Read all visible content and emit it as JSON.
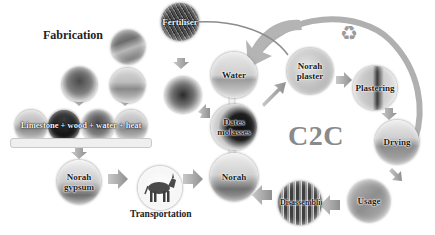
{
  "diagram": {
    "section_title": "Fabrication",
    "cycle_label": "C2C",
    "raw_materials_bar": "Limestone + wood + water + heat",
    "nodes": {
      "norah_gypsum": "Norah gypsum",
      "transportation": "Transportation",
      "norah": "Norah",
      "water": "Water",
      "dates_molasses": "Dates molasses",
      "fertilizer": "Fertiliser",
      "norah_plaster": "Norah plaster",
      "plastering": "Plastering",
      "drying": "Drying",
      "usage": "Usage",
      "disassembling": "Disassembling"
    },
    "icons": {
      "recycle": "recycle-icon"
    },
    "colors": {
      "arrow": "#9e9e9e",
      "cycle_text": "#8a8a8a",
      "label_text": "#1a1a1a",
      "background": "#ffffff"
    },
    "flow": [
      [
        "raw_materials",
        "norah_gypsum"
      ],
      [
        "norah_gypsum",
        "transportation"
      ],
      [
        "transportation",
        "norah"
      ],
      [
        "water",
        "norah"
      ],
      [
        "dates_molasses",
        "norah"
      ],
      [
        "fertilizer",
        "seed"
      ],
      [
        "norah",
        "norah_plaster"
      ],
      [
        "norah_plaster",
        "plastering"
      ],
      [
        "plastering",
        "drying"
      ],
      [
        "drying",
        "usage"
      ],
      [
        "usage",
        "disassembling"
      ],
      [
        "disassembling",
        "norah"
      ],
      [
        "disassembling",
        "water"
      ]
    ]
  }
}
